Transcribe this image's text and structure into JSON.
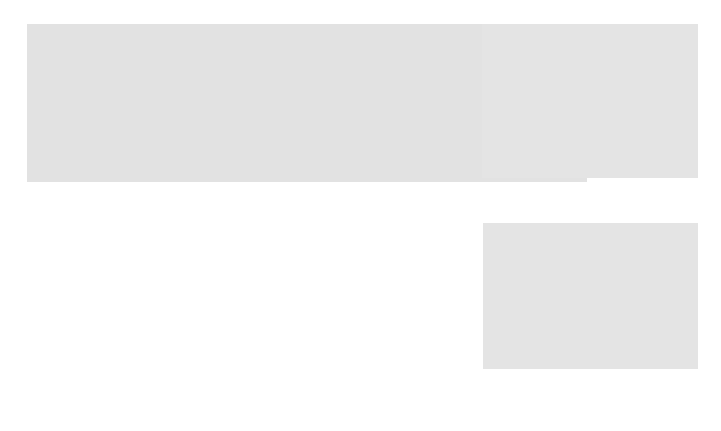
{
  "figure": {
    "panels": [
      {
        "id": "a",
        "label": "(a)"
      },
      {
        "id": "b",
        "label": "(b)"
      },
      {
        "id": "c",
        "label": "(c)"
      }
    ]
  },
  "panel_a": {
    "extracellular_left": "Extracellular\nfluid",
    "cytoplasm": "Cytoplasm",
    "plasma_membrane_top": "Plasma\nmembrane",
    "extracellular_right": "Extracellular\nfluid",
    "pit": "Pit",
    "ingested_substance": "Ingested\nsubstance",
    "detachment": "Detachment\nof vesicle",
    "vesicle_containing": "Vesicle containing\ningested material",
    "plasma_membrane_left": "Plasma\nmembrane",
    "vesicle": "Vesicle",
    "lysosome": "Lysosome",
    "step1_num": "1",
    "step1": "Vesicle fusing\nwith lysosome\nfor digestion",
    "step2_num": "2",
    "step2": "Release of\ncontents to\ncytoplasm",
    "step3_num": "3",
    "step3": "Transport to plasma\nmembrane and\nexocytosis of\nvesicle contents",
    "step4_num": "4",
    "step4": "Recycling of membrane\nand receptors (if present)\nto plasma membrane"
  },
  "panel_b": {
    "extracellular": "Extracellular\nfluid",
    "cytoplasm": "Cytoplasm",
    "bacterium": "Bacterium\nor other\nparticle",
    "pseudopod": "Pseudopod"
  },
  "panel_c": {
    "membrane_receptor": "Membrane\nreceptor"
  },
  "colors": {
    "background": "#e2e2e2",
    "membrane": "#6a6a6a",
    "particle": "#8a9a7a",
    "triangle": "#333333"
  }
}
